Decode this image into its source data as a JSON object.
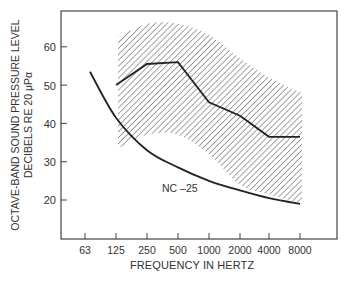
{
  "chart_data": {
    "type": "line",
    "title": "",
    "xlabel": "FREQUENCY IN HERTZ",
    "ylabel_line1": "OCTAVE-BAND SOUND PRESSURE LEVEL",
    "ylabel_line2": "DECIBELS RE 20 μPα",
    "x_scale": "log2 (octave bands)",
    "categories": [
      "63",
      "125",
      "250",
      "500",
      "1000",
      "2000",
      "4000",
      "8000"
    ],
    "y_ticks": [
      20,
      30,
      40,
      50,
      60
    ],
    "ylim": [
      11,
      69
    ],
    "grid": false,
    "series": [
      {
        "name": "Measured spectrum",
        "style": "solid thick line",
        "x": [
          "125",
          "250",
          "500",
          "1000",
          "2000",
          "4000",
          "8000"
        ],
        "values": [
          50,
          55.5,
          56,
          45.5,
          42,
          36.5,
          36.5
        ]
      },
      {
        "name": "NC -25",
        "style": "solid curve",
        "x": [
          "63",
          "125",
          "250",
          "500",
          "1000",
          "2000",
          "4000",
          "8000"
        ],
        "values": [
          53.5,
          41.5,
          33,
          28.5,
          25,
          22.5,
          20.5,
          19
        ]
      },
      {
        "name": "Range band (hatched)",
        "style": "diagonal hatch area",
        "x": [
          "125",
          "250",
          "500",
          "1000",
          "2000",
          "4000",
          "8000"
        ],
        "upper": [
          62.5,
          66,
          66,
          63,
          57,
          52,
          48
        ],
        "lower": [
          33.5,
          37,
          37,
          32,
          24,
          21.5,
          19
        ]
      }
    ],
    "annotations": [
      "NC –25"
    ]
  }
}
